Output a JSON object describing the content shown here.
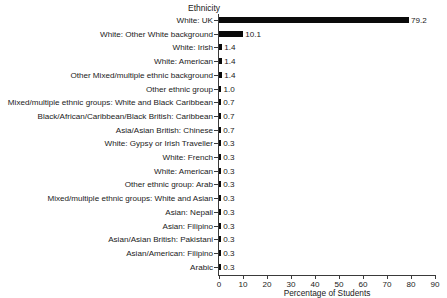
{
  "chart_data": {
    "type": "bar",
    "orientation": "horizontal",
    "title": "",
    "xlabel": "Percentage of Students",
    "ylabel": "Ethnicity",
    "xlim": [
      0,
      90
    ],
    "xticks": [
      0,
      10,
      20,
      30,
      40,
      50,
      60,
      70,
      80,
      90
    ],
    "grid": false,
    "legend": false,
    "bar_color": "#0a0a0a",
    "background_color": "#ffffff",
    "categories": [
      "White: UK",
      "White: Other White background",
      "White: Irish",
      "White: American",
      "Other Mixed/multiple ethnic background",
      "Other ethnic group",
      "Mixed/multiple ethnic groups: White and Black Caribbean",
      "Black/African/Caribbean/Black British: Caribbean",
      "Asia/Asian British: Chinese",
      "White: Gypsy or Irish Traveller",
      "White: French",
      "White: American",
      "Other ethnic group: Arab",
      "Mixed/multiple ethnic groups: White and Asian",
      "Asian: Nepali",
      "Asian: Filipino",
      "Asian/Asian British: Pakistani",
      "Asian/American: Filipino",
      "Arabic"
    ],
    "values": [
      79.2,
      10.1,
      1.4,
      1.4,
      1.4,
      1.0,
      0.7,
      0.7,
      0.7,
      0.3,
      0.3,
      0.3,
      0.3,
      0.3,
      0.3,
      0.3,
      0.3,
      0.3,
      0.3
    ],
    "value_labels": [
      "79.2",
      "10.1",
      "1.4",
      "1.4",
      "1.4",
      "1.0",
      "0.7",
      "0.7",
      "0.7",
      "0.3",
      "0.3",
      "0.3",
      "0.3",
      "0.3",
      "0.3",
      "0.3",
      "0.3",
      "0.3",
      "0.3"
    ]
  }
}
